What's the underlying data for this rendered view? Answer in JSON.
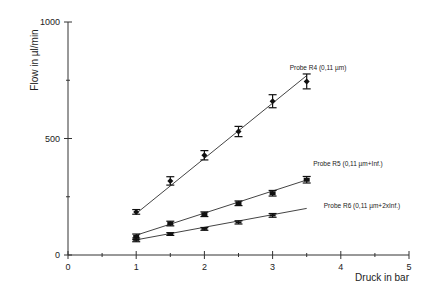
{
  "chart_data": {
    "type": "line",
    "title": "",
    "xlabel": "Druck in bar",
    "ylabel": "Flow in µl/min",
    "xlim": [
      0,
      5
    ],
    "ylim": [
      0,
      1000
    ],
    "x_ticks_major": [
      0,
      1,
      2,
      3,
      4,
      5
    ],
    "x_ticks_minor": [
      0.5,
      1.5,
      2.5,
      3.5,
      4.5
    ],
    "y_ticks_major": [
      0,
      500,
      1000
    ],
    "y_ticks_minor": [
      250,
      750
    ],
    "grid": false,
    "legend": "inline labels at line ends",
    "series": [
      {
        "name": "Probe R4 (0,11 µm)",
        "marker": "diamond",
        "x": [
          1.0,
          1.5,
          2.0,
          2.5,
          3.0,
          3.5
        ],
        "values": [
          185,
          318,
          428,
          530,
          660,
          745
        ],
        "errors": [
          10,
          18,
          20,
          22,
          28,
          32
        ],
        "fit_line": {
          "x0": 1.0,
          "y0": 178,
          "x1": 3.5,
          "y1": 770
        }
      },
      {
        "name": "Probe R5 (0,11 µm+Inf.)",
        "marker": "circle",
        "x": [
          1.0,
          1.5,
          2.0,
          2.5,
          3.0,
          3.5
        ],
        "values": [
          78,
          135,
          175,
          222,
          265,
          323
        ],
        "errors": [
          12,
          10,
          10,
          10,
          12,
          14
        ],
        "fit_line": {
          "x0": 1.0,
          "y0": 85,
          "x1": 3.5,
          "y1": 322
        }
      },
      {
        "name": "Probe R6 (0,11 µm+2xInf.)",
        "marker": "dash",
        "x": [
          1.0,
          1.5,
          2.0,
          2.5,
          3.0
        ],
        "values": [
          65,
          90,
          112,
          140,
          170
        ],
        "errors": [
          8,
          6,
          6,
          7,
          8
        ],
        "fit_line": {
          "x0": 1.0,
          "y0": 65,
          "x1": 3.5,
          "y1": 200
        }
      }
    ]
  },
  "labels": {
    "ylabel": "Flow in µl/min",
    "xlabel": "Druck in bar",
    "y_ticks": [
      "0",
      "500",
      "1000"
    ],
    "x_ticks": [
      "0",
      "1",
      "2",
      "3",
      "4",
      "5"
    ],
    "series": [
      "Probe R4 (0,11 µm)",
      "Probe R5 (0,11 µm+Inf.)",
      "Probe R6 (0,11 µm+2xInf.)"
    ]
  },
  "colors": {
    "axis": "#333333",
    "line": "#444444",
    "marker": "#111111",
    "text": "#222222"
  }
}
